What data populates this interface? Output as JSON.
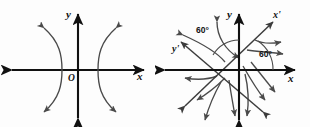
{
  "figure": {
    "width": 310,
    "height": 127,
    "background": "#fdfdfd",
    "stroke_color": "#111111",
    "fieldline_color": "#4a4a4a"
  },
  "panels": [
    {
      "id": "left",
      "name": "unrotated-axes-panel",
      "origin_label": "O",
      "axes": [
        {
          "name": "x-axis",
          "label": "x",
          "orientation": "horizontal",
          "double_headed": true
        },
        {
          "name": "y-axis",
          "label": "y",
          "orientation": "vertical",
          "double_headed": true
        }
      ],
      "fieldlines": [
        {
          "name": "left-branch",
          "shape": "arc",
          "opens": "left",
          "arrowheads": 2
        },
        {
          "name": "right-branch",
          "shape": "arc",
          "opens": "right",
          "arrowheads": 2
        }
      ]
    },
    {
      "id": "right",
      "name": "rotated-axes-panel",
      "origin_label": "",
      "axes": [
        {
          "name": "x-axis",
          "label": "x",
          "orientation": "horizontal",
          "double_headed": true
        },
        {
          "name": "y-axis",
          "label": "y",
          "orientation": "vertical",
          "double_headed": true
        },
        {
          "name": "x-prime-axis",
          "label": "x'",
          "orientation": "rotated",
          "double_headed": true
        },
        {
          "name": "y-prime-axis",
          "label": "y'",
          "orientation": "rotated",
          "double_headed": true
        }
      ],
      "angles": [
        {
          "name": "angle-upper-left",
          "value": "60°",
          "between": "y-axis and y'-axis"
        },
        {
          "name": "angle-lower-right",
          "value": "60°",
          "between": "x-axis and x'-axis"
        }
      ],
      "fieldlines": [
        {
          "name": "fieldline-a",
          "shape": "arc",
          "arrowheads": 2
        },
        {
          "name": "fieldline-b",
          "shape": "arc",
          "arrowheads": 2
        },
        {
          "name": "fieldline-c",
          "shape": "arc",
          "arrowheads": 2
        },
        {
          "name": "fieldline-d",
          "shape": "arc",
          "arrowheads": 2
        },
        {
          "name": "fieldline-e",
          "shape": "arc",
          "arrowheads": 2
        },
        {
          "name": "fieldline-f",
          "shape": "arc",
          "arrowheads": 2
        }
      ]
    }
  ],
  "labels": {
    "left_x": "x",
    "left_y": "y",
    "left_origin": "O",
    "right_x": "x",
    "right_y": "y",
    "right_x_prime": "x'",
    "right_y_prime": "y'",
    "right_angle_1": "60°",
    "right_angle_2": "60°"
  }
}
